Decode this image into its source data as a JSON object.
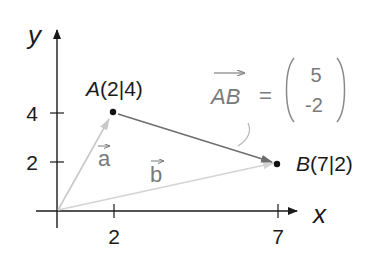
{
  "axes": {
    "x_label": "x",
    "y_label": "y",
    "x_ticks": [
      {
        "value": "2",
        "px": 114
      },
      {
        "value": "7",
        "px": 278
      }
    ],
    "y_ticks": [
      {
        "value": "4",
        "py": 113
      },
      {
        "value": "2",
        "py": 162
      }
    ],
    "origin_px": [
      57,
      211
    ]
  },
  "points": {
    "A": {
      "name": "A",
      "coords": "(2|4)",
      "label": "A(2|4)"
    },
    "B": {
      "name": "B",
      "coords": "(7|2)",
      "label": "B(7|2)"
    }
  },
  "vectors": {
    "a": {
      "label": "a",
      "from": "O",
      "to": "A",
      "color": "#c8c8c8"
    },
    "b": {
      "label": "b",
      "from": "O",
      "to": "B",
      "color": "#d4d4d4"
    },
    "AB": {
      "label": "AB",
      "from": "A",
      "to": "B",
      "color": "#6e6e6e"
    }
  },
  "equation": {
    "lhs": "AB",
    "equals": "=",
    "top": "5",
    "bottom": "-2"
  },
  "colors": {
    "axis": "#1a1a1a",
    "text": "#1a1a1a",
    "vector_label": "#7a7a7a",
    "leader_line": "#b5b5b5"
  }
}
